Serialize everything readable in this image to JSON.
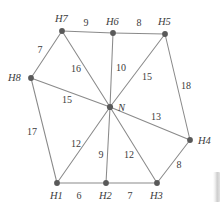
{
  "figure": {
    "colors": {
      "edge": "#8a8a8a",
      "node": "#595959",
      "label": "#3c3c3c",
      "background": "#ffffff"
    }
  },
  "chart_data": {
    "type": "diagram",
    "subtype": "weighted-undirected-graph",
    "title": "",
    "nodes": [
      {
        "id": "N",
        "label": "N",
        "x": 110,
        "y": 107,
        "label_x": 118,
        "label_y": 111,
        "role": "hub"
      },
      {
        "id": "H1",
        "label": "H1",
        "x": 57,
        "y": 183,
        "label_x": 50,
        "label_y": 199,
        "role": "peripheral"
      },
      {
        "id": "H2",
        "label": "H2",
        "x": 106,
        "y": 183,
        "label_x": 99,
        "label_y": 199,
        "role": "peripheral"
      },
      {
        "id": "H3",
        "label": "H3",
        "x": 157,
        "y": 183,
        "label_x": 150,
        "label_y": 199,
        "role": "peripheral"
      },
      {
        "id": "H4",
        "label": "H4",
        "x": 190,
        "y": 140,
        "label_x": 198,
        "label_y": 144,
        "role": "peripheral"
      },
      {
        "id": "H5",
        "label": "H5",
        "x": 165,
        "y": 34,
        "label_x": 158,
        "label_y": 25,
        "role": "peripheral"
      },
      {
        "id": "H6",
        "label": "H6",
        "x": 113,
        "y": 33,
        "label_x": 106,
        "label_y": 25,
        "role": "peripheral"
      },
      {
        "id": "H7",
        "label": "H7",
        "x": 62,
        "y": 31,
        "label_x": 55,
        "label_y": 22,
        "role": "peripheral"
      },
      {
        "id": "H8",
        "label": "H8",
        "x": 31,
        "y": 78,
        "label_x": 8,
        "label_y": 81,
        "role": "peripheral"
      }
    ],
    "edges": [
      {
        "from": "H7",
        "to": "H6",
        "weight": "9",
        "label_x": 86,
        "label_y": 26
      },
      {
        "from": "H6",
        "to": "H5",
        "weight": "8",
        "label_x": 139,
        "label_y": 26
      },
      {
        "from": "H8",
        "to": "H7",
        "weight": "7",
        "label_x": 40,
        "label_y": 53
      },
      {
        "from": "H7",
        "to": "N",
        "weight": "16",
        "label_x": 76,
        "label_y": 72
      },
      {
        "from": "H6",
        "to": "N",
        "weight": "10",
        "label_x": 121,
        "label_y": 71
      },
      {
        "from": "H5",
        "to": "N",
        "weight": "15",
        "label_x": 147,
        "label_y": 80
      },
      {
        "from": "H5",
        "to": "H4",
        "weight": "18",
        "label_x": 186,
        "label_y": 89
      },
      {
        "from": "H8",
        "to": "N",
        "weight": "15",
        "label_x": 67,
        "label_y": 103
      },
      {
        "from": "N",
        "to": "H4",
        "weight": "13",
        "label_x": 156,
        "label_y": 120
      },
      {
        "from": "H8",
        "to": "H1",
        "weight": "17",
        "label_x": 32,
        "label_y": 135
      },
      {
        "from": "N",
        "to": "H1",
        "weight": "12",
        "label_x": 76,
        "label_y": 147
      },
      {
        "from": "N",
        "to": "H2",
        "weight": "9",
        "label_x": 101,
        "label_y": 158
      },
      {
        "from": "N",
        "to": "H3",
        "weight": "12",
        "label_x": 129,
        "label_y": 158
      },
      {
        "from": "H3",
        "to": "H4",
        "weight": "8",
        "label_x": 179,
        "label_y": 168
      },
      {
        "from": "H1",
        "to": "H2",
        "weight": "6",
        "label_x": 79,
        "label_y": 199
      },
      {
        "from": "H2",
        "to": "H3",
        "weight": "7",
        "label_x": 130,
        "label_y": 199
      }
    ],
    "node_labels": [
      "H7",
      "H6",
      "H5",
      "H8",
      "N",
      "H4",
      "H1",
      "H2",
      "H3"
    ],
    "weight_labels": [
      "9",
      "8",
      "7",
      "16",
      "10",
      "15",
      "18",
      "15",
      "13",
      "17",
      "12",
      "9",
      "12",
      "8",
      "6",
      "7"
    ]
  }
}
